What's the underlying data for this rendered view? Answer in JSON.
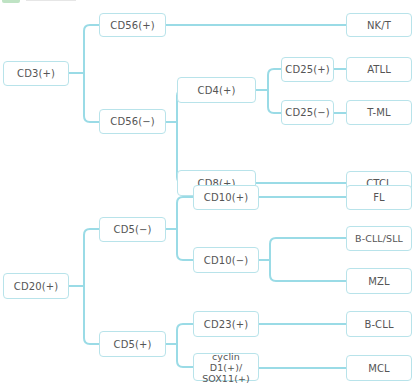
{
  "header": {
    "tag": "",
    "text": ""
  },
  "colors": {
    "line": "#9adbe6",
    "node_border": "#b8e3ea",
    "text": "#555555",
    "header_tag": "#bfe3c4"
  },
  "nodes": {
    "cd3": {
      "label": "CD3(+)",
      "x": 3,
      "y": 61,
      "w": 66,
      "h": 25
    },
    "cd56p": {
      "label": "CD56(+)",
      "x": 99,
      "y": 13,
      "w": 67,
      "h": 24
    },
    "nkt": {
      "label": "NK/T",
      "x": 346,
      "y": 13,
      "w": 66,
      "h": 24
    },
    "cd56n": {
      "label": "CD56(−)",
      "x": 99,
      "y": 109,
      "w": 67,
      "h": 25
    },
    "cd4": {
      "label": "CD4(+)",
      "x": 177,
      "y": 77,
      "w": 79,
      "h": 26
    },
    "cd25p": {
      "label": "CD25(+)",
      "x": 281,
      "y": 57,
      "w": 53,
      "h": 25
    },
    "atll": {
      "label": "ATLL",
      "x": 346,
      "y": 57,
      "w": 66,
      "h": 25
    },
    "cd25n": {
      "label": "CD25(−)",
      "x": 281,
      "y": 100,
      "w": 53,
      "h": 25
    },
    "tml": {
      "label": "T-ML",
      "x": 346,
      "y": 100,
      "w": 66,
      "h": 25
    },
    "cd8": {
      "label": "CD8(+)",
      "x": 177,
      "y": 170,
      "w": 79,
      "h": 26
    },
    "ctcl": {
      "label": "CTCL",
      "x": 346,
      "y": 171,
      "w": 66,
      "h": 25
    },
    "cd20": {
      "label": "CD20(+)",
      "x": 3,
      "y": 273,
      "w": 66,
      "h": 26
    },
    "cd5n": {
      "label": "CD5(−)",
      "x": 99,
      "y": 217,
      "w": 67,
      "h": 25
    },
    "cd10p": {
      "label": "CD10(+)",
      "x": 193,
      "y": 185,
      "w": 66,
      "h": 25
    },
    "fl": {
      "label": "FL",
      "x": 346,
      "y": 185,
      "w": 66,
      "h": 25
    },
    "cd10n": {
      "label": "CD10(−)",
      "x": 193,
      "y": 247,
      "w": 66,
      "h": 26
    },
    "bcllsll": {
      "label": "B-CLL/SLL",
      "x": 346,
      "y": 226,
      "w": 66,
      "h": 25
    },
    "mzl": {
      "label": "MZL",
      "x": 346,
      "y": 268,
      "w": 66,
      "h": 26
    },
    "cd5p": {
      "label": "CD5(+)",
      "x": 99,
      "y": 331,
      "w": 67,
      "h": 26
    },
    "cd23": {
      "label": "CD23(+)",
      "x": 193,
      "y": 311,
      "w": 66,
      "h": 26
    },
    "bcll": {
      "label": "B-CLL",
      "x": 346,
      "y": 311,
      "w": 66,
      "h": 26
    },
    "cyclin": {
      "label": "cyclin D1(+)/ SOX11(+)",
      "x": 193,
      "y": 353,
      "w": 66,
      "h": 28
    },
    "mcl": {
      "label": "MCL",
      "x": 346,
      "y": 355,
      "w": 66,
      "h": 26
    }
  }
}
